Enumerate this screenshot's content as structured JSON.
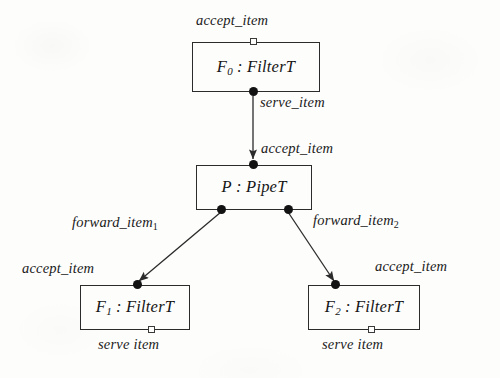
{
  "diagram": {
    "type": "uml-component-diagram",
    "background_color": "#fdfdfc",
    "line_color": "#2b2b2b",
    "nodes": [
      {
        "id": "f0",
        "name": "F",
        "subscript": "0",
        "separator": " : ",
        "type_name": "FilterT",
        "x": 192,
        "y": 42,
        "width": 128,
        "height": 50
      },
      {
        "id": "p",
        "name": "P",
        "subscript": "",
        "separator": " : ",
        "type_name": "PipeT",
        "x": 196,
        "y": 165,
        "width": 116,
        "height": 45
      },
      {
        "id": "f1",
        "name": "F",
        "subscript": "1",
        "separator": " : ",
        "type_name": "FilterT",
        "x": 80,
        "y": 285,
        "width": 110,
        "height": 45
      },
      {
        "id": "f2",
        "name": "F",
        "subscript": "2",
        "separator": " : ",
        "type_name": "FilterT",
        "x": 308,
        "y": 285,
        "width": 112,
        "height": 45
      }
    ],
    "ports": [
      {
        "id": "f0-accept",
        "shape": "socket",
        "x": 250,
        "y": 38
      },
      {
        "id": "f0-serve",
        "shape": "ball",
        "x": 249,
        "y": 87
      },
      {
        "id": "p-accept",
        "shape": "ball",
        "x": 249,
        "y": 160
      },
      {
        "id": "p-forward1",
        "shape": "ball",
        "x": 221,
        "y": 205
      },
      {
        "id": "p-forward2",
        "shape": "ball",
        "x": 281,
        "y": 205
      },
      {
        "id": "f1-accept",
        "shape": "ball",
        "x": 130,
        "y": 280
      },
      {
        "id": "f1-serve",
        "shape": "socket",
        "x": 148,
        "y": 326
      },
      {
        "id": "f2-accept",
        "shape": "ball",
        "x": 335,
        "y": 280
      },
      {
        "id": "f2-serve",
        "shape": "socket",
        "x": 368,
        "y": 326
      }
    ],
    "edges": [
      {
        "id": "f0-to-p",
        "from": "f0-serve",
        "to": "p-accept",
        "x1": 253,
        "y1": 96,
        "x2": 253,
        "y2": 160
      },
      {
        "id": "p-to-f1",
        "from": "p-forward1",
        "to": "f1-accept",
        "x1": 221,
        "y1": 212,
        "x2": 140,
        "y2": 281
      },
      {
        "id": "p-to-f2",
        "from": "p-forward2",
        "to": "f2-accept",
        "x1": 288,
        "y1": 212,
        "x2": 335,
        "y2": 281
      }
    ],
    "labels": [
      {
        "id": "f0-accept-label",
        "text": "accept_item",
        "subscript": "",
        "x": 196,
        "y": 12
      },
      {
        "id": "f0-serve-label",
        "text": "serve_item",
        "subscript": "",
        "x": 260,
        "y": 94
      },
      {
        "id": "p-accept-label",
        "text": "accept_item",
        "subscript": "",
        "x": 261,
        "y": 140
      },
      {
        "id": "p-forward1-label",
        "text": "forward_item",
        "subscript": "1",
        "x": 72,
        "y": 214
      },
      {
        "id": "p-forward2-label",
        "text": "forward_item",
        "subscript": "2",
        "x": 313,
        "y": 212
      },
      {
        "id": "f1-accept-label",
        "text": "accept_item",
        "subscript": "",
        "x": 22,
        "y": 260
      },
      {
        "id": "f1-serve-label",
        "text": "serve item",
        "subscript": "",
        "x": 98,
        "y": 336
      },
      {
        "id": "f2-accept-label",
        "text": "accept_item",
        "subscript": "",
        "x": 375,
        "y": 258
      },
      {
        "id": "f2-serve-label",
        "text": "serve item",
        "subscript": "",
        "x": 322,
        "y": 336
      }
    ]
  }
}
